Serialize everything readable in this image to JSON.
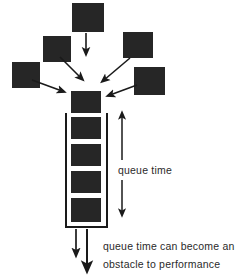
{
  "diagram": {
    "colors": {
      "box_fill": "#262626",
      "stroke": "#1a1a1a",
      "text": "#2a2a2a",
      "background": "#ffffff"
    },
    "labels": {
      "queue_time": "queue time",
      "obstacle_line_1": "queue time can become an",
      "obstacle_line_2": "obstacle to performance"
    },
    "source_boxes": [
      {
        "name": "source-box-top",
        "x": 72,
        "y": 3,
        "w": 32,
        "h": 29
      },
      {
        "name": "source-box-upper-left",
        "x": 43,
        "y": 36,
        "w": 28,
        "h": 26
      },
      {
        "name": "source-box-far-left",
        "x": 12,
        "y": 62,
        "w": 28,
        "h": 26
      },
      {
        "name": "source-box-upper-right",
        "x": 123,
        "y": 32,
        "w": 30,
        "h": 26
      },
      {
        "name": "source-box-lower-right",
        "x": 134,
        "y": 67,
        "w": 31,
        "h": 28
      }
    ],
    "queue": {
      "head_box": {
        "name": "queue-head-box",
        "x": 71,
        "y": 91,
        "w": 30,
        "h": 22
      },
      "container": {
        "x": 65,
        "y": 113,
        "w": 43,
        "h": 115
      },
      "item_count": 4,
      "items": [
        {
          "name": "queue-item-1",
          "x": 71,
          "y": 117,
          "w": 30,
          "h": 22
        },
        {
          "name": "queue-item-2",
          "x": 71,
          "y": 144,
          "w": 30,
          "h": 22
        },
        {
          "name": "queue-item-3",
          "x": 71,
          "y": 171,
          "w": 30,
          "h": 22
        },
        {
          "name": "queue-item-4",
          "x": 71,
          "y": 198,
          "w": 30,
          "h": 24
        }
      ]
    },
    "arrows": {
      "feed_arrows": [
        {
          "name": "feed-arrow-from-top",
          "x1": 86,
          "y1": 33,
          "x2": 86,
          "y2": 54
        },
        {
          "name": "feed-arrow-from-upper-left",
          "x1": 60,
          "y1": 58,
          "x2": 82,
          "y2": 80
        },
        {
          "name": "feed-arrow-from-far-left",
          "x1": 33,
          "y1": 82,
          "x2": 63,
          "y2": 91
        },
        {
          "name": "feed-arrow-from-upper-right",
          "x1": 129,
          "y1": 58,
          "x2": 103,
          "y2": 81
        },
        {
          "name": "feed-arrow-from-lower-right",
          "x1": 136,
          "y1": 84,
          "x2": 110,
          "y2": 95
        }
      ],
      "queue_time_arrow": {
        "name": "queue-time-double-arrow",
        "x": 122,
        "y_top": 112,
        "y_bottom": 216
      },
      "output_arrows": [
        {
          "name": "output-arrow-short",
          "x": 76,
          "y1": 229,
          "y2": 256
        },
        {
          "name": "output-arrow-long",
          "x": 87,
          "y1": 229,
          "y2": 271
        }
      ]
    }
  }
}
